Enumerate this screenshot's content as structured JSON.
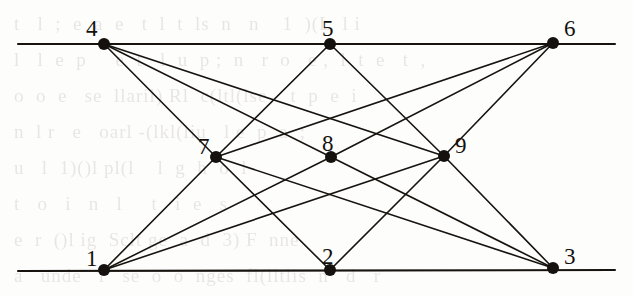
{
  "figure": {
    "kind": "point-line-incidence-configuration",
    "stroke_color": "#17130f",
    "node_color": "#14110e",
    "background_color": "#fdfdfc",
    "node_radius": 6,
    "line_width": 1.6,
    "rule_width": 2.1,
    "width": 633,
    "height": 296
  },
  "nodes": [
    {
      "id": "1",
      "label": "1",
      "x": 104,
      "y": 270,
      "label_x": 86,
      "label_y": 247,
      "row": "bottom"
    },
    {
      "id": "2",
      "label": "2",
      "x": 330,
      "y": 270,
      "label_x": 322,
      "label_y": 245,
      "row": "bottom"
    },
    {
      "id": "3",
      "label": "3",
      "x": 553,
      "y": 268,
      "label_x": 564,
      "label_y": 245,
      "row": "bottom"
    },
    {
      "id": "4",
      "label": "4",
      "x": 104,
      "y": 44,
      "label_x": 86,
      "label_y": 17,
      "row": "top"
    },
    {
      "id": "5",
      "label": "5",
      "x": 330,
      "y": 44,
      "label_x": 322,
      "label_y": 17,
      "row": "top"
    },
    {
      "id": "6",
      "label": "6",
      "x": 553,
      "y": 43,
      "label_x": 564,
      "label_y": 17,
      "row": "top"
    },
    {
      "id": "7",
      "label": "7",
      "x": 216,
      "y": 157,
      "label_x": 198,
      "label_y": 135,
      "row": "middle"
    },
    {
      "id": "8",
      "label": "8",
      "x": 331,
      "y": 157,
      "label_x": 322,
      "label_y": 132,
      "row": "middle"
    },
    {
      "id": "9",
      "label": "9",
      "x": 444,
      "y": 156,
      "label_x": 455,
      "label_y": 134,
      "row": "middle"
    }
  ],
  "rules": [
    {
      "id": "top-rule",
      "x1": 18,
      "y1": 44,
      "x2": 615,
      "y2": 44,
      "name": "upper-horizontal-line"
    },
    {
      "id": "bottom-rule",
      "x1": 18,
      "y1": 271,
      "x2": 615,
      "y2": 270,
      "name": "lower-horizontal-line"
    }
  ],
  "edges": [
    {
      "from": "4",
      "to": "7"
    },
    {
      "from": "4",
      "to": "8"
    },
    {
      "from": "4",
      "to": "9"
    },
    {
      "from": "5",
      "to": "7"
    },
    {
      "from": "5",
      "to": "9"
    },
    {
      "from": "6",
      "to": "7"
    },
    {
      "from": "6",
      "to": "8"
    },
    {
      "from": "6",
      "to": "9"
    },
    {
      "from": "1",
      "to": "7"
    },
    {
      "from": "1",
      "to": "8"
    },
    {
      "from": "1",
      "to": "9"
    },
    {
      "from": "2",
      "to": "7"
    },
    {
      "from": "2",
      "to": "9"
    },
    {
      "from": "3",
      "to": "7"
    },
    {
      "from": "3",
      "to": "8"
    },
    {
      "from": "3",
      "to": "9"
    }
  ],
  "background_text": {
    "visible": true,
    "note": "faint show-through of printed text from the reverse side of the scanned page",
    "lines": [
      "t   l  ;  e  a  e   t  l  t  ls  n   n    1  )(L  l i",
      "l   l  e  p     e  t   l  u  p ;  n   r  o   e ,  l  t  e   t  ,",
      "o  o  e   se  llaril) Rl  c(ltl(lse    t  p  e  i",
      "n  l r   e   oarl -(lkl(liu   l e  p  a  ;",
      "u   l  1)()l pl(l    l  g  h  o  l",
      "t   o   i   n   l     t   i  e   s",
      "e  r  ()l ig  Sclt ge  a  d  3) F  nne",
      "a   unde   l   se  o  o  nges  fl(lltlis  n   d   r"
    ]
  }
}
